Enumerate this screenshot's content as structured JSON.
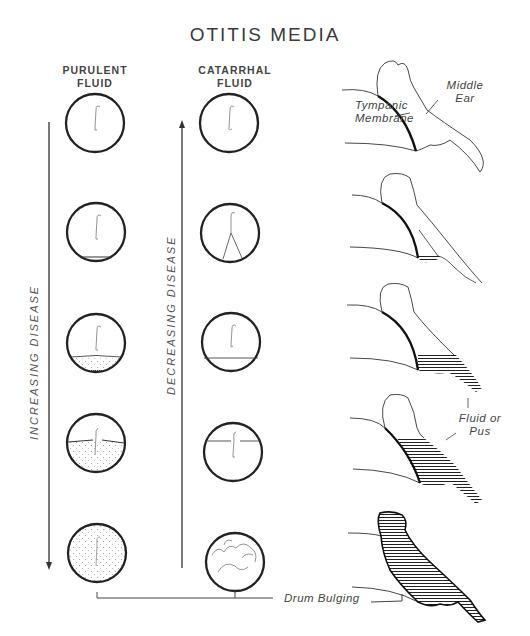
{
  "title": "OTITIS MEDIA",
  "columns": {
    "purulent": {
      "line1": "PURULENT",
      "line2": "FLUID"
    },
    "catarrhal": {
      "line1": "CATARRHAL",
      "line2": "FLUID"
    }
  },
  "arrows": {
    "increasing": {
      "label": "INCREASING DISEASE",
      "direction": "down"
    },
    "decreasing": {
      "label": "DECREASING DISEASE",
      "direction": "up"
    }
  },
  "annotations": {
    "tympanic": {
      "line1": "Tympanic",
      "line2": "Membrane"
    },
    "middle_ear": {
      "line1": "Middle",
      "line2": "Ear"
    },
    "fluid": {
      "line1": "Fluid or",
      "line2": "Pus"
    },
    "drum_bulging": "Drum Bulging"
  },
  "stages": [
    {
      "stage": 1,
      "purulent": "clear",
      "catarrhal": "clear",
      "side_view": "normal"
    },
    {
      "stage": 2,
      "purulent": "thin fluid line at bottom",
      "catarrhal": "light reflex lines",
      "side_view": "small fluid pocket"
    },
    {
      "stage": 3,
      "purulent": "fluid level with stippling",
      "catarrhal": "fluid level line",
      "side_view": "fluid in lower middle ear"
    },
    {
      "stage": 4,
      "purulent": "mostly filled, stippled",
      "catarrhal": "high fluid level line",
      "side_view": "fluid filling most of middle ear"
    },
    {
      "stage": 5,
      "purulent": "completely filled, stippled",
      "catarrhal": "bubbles / irregular lines",
      "side_view": "fully filled, bulging drum"
    }
  ],
  "colors": {
    "ink": "#222222",
    "background": "#ffffff"
  }
}
